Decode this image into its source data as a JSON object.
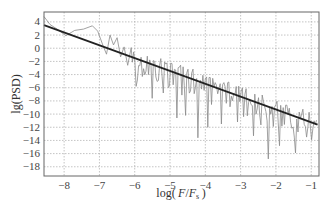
{
  "chart_data": {
    "type": "line",
    "title": "",
    "xlabel": "log( F/F_s )",
    "xlabel_parts": {
      "pre": "log( ",
      "var": "F",
      "slash": "/",
      "var2": "F",
      "sub": "s",
      "post": " )"
    },
    "ylabel": "lg(PSD)",
    "xlim": [
      -8.57,
      -0.78
    ],
    "ylim": [
      -19.4,
      5.5
    ],
    "xticks": [
      -8,
      -7,
      -6,
      -5,
      -4,
      -3,
      -2,
      -1
    ],
    "xtick_labels": [
      "−8",
      "−7",
      "−6",
      "−5",
      "−4",
      "−3",
      "−2",
      "−1"
    ],
    "yticks": [
      4,
      2,
      0,
      -2,
      -4,
      -6,
      -8,
      -10,
      -12,
      -14,
      -16,
      -18
    ],
    "ytick_labels": [
      "4",
      "2",
      "0",
      "−2",
      "−4",
      "−6",
      "−8",
      "−10",
      "−12",
      "−14",
      "−16",
      "−18"
    ],
    "grid": true,
    "grid_style": "dotted",
    "legend": null,
    "series": [
      {
        "name": "PSD",
        "color": "#8a8a8a",
        "style": "noisy-line",
        "anchors_x": [
          -8.57,
          -8.4,
          -8.2,
          -7.95,
          -7.7,
          -7.45,
          -7.2,
          -7.05,
          -6.9,
          -6.8,
          -6.7,
          -6.6,
          -6.5,
          -6.4,
          -6.3,
          -6.2,
          -6.1
        ],
        "anchors_y": [
          4.8,
          3.6,
          2.9,
          1.9,
          2.7,
          2.9,
          3.4,
          2.6,
          0.4,
          -0.9,
          2.0,
          0.5,
          1.6,
          -1.3,
          0.2,
          -2.6,
          0.1
        ],
        "dense_from_x": -6.1,
        "dense_to_x": -0.82,
        "dense_step": 0.035,
        "noise_amplitude_up": 1.6,
        "noise_amplitude_down": 3.2,
        "deep_spikes": [
          {
            "x": -6.4,
            "y": -5.2
          },
          {
            "x": -5.95,
            "y": -5.8
          },
          {
            "x": -5.5,
            "y": -7.6
          },
          {
            "x": -5.2,
            "y": -6.8
          },
          {
            "x": -4.82,
            "y": -10.6
          },
          {
            "x": -4.55,
            "y": -10.2
          },
          {
            "x": -4.22,
            "y": -13.6
          },
          {
            "x": -3.92,
            "y": -12.0
          },
          {
            "x": -3.55,
            "y": -11.5
          },
          {
            "x": -3.1,
            "y": -11.2
          },
          {
            "x": -2.62,
            "y": -13.3
          },
          {
            "x": -2.2,
            "y": -16.8
          },
          {
            "x": -1.9,
            "y": -14.8
          },
          {
            "x": -1.45,
            "y": -15.9
          },
          {
            "x": -1.12,
            "y": -13.5
          }
        ]
      },
      {
        "name": "Linear fit",
        "color": "#222222",
        "style": "line",
        "x": [
          -8.57,
          -0.82
        ],
        "y": [
          3.5,
          -11.6
        ]
      }
    ]
  }
}
